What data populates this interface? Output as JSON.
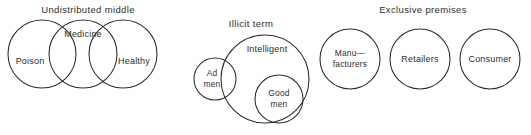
{
  "figure": {
    "background_color": "#ffffff",
    "stroke_color": "#2b2b2b",
    "text_color": "#2e2e2e",
    "width": 531,
    "height": 135
  },
  "diagrams": [
    {
      "id": "undistributed-middle",
      "title": "Undistributed middle",
      "title_x": 88,
      "title_y": 10,
      "type": "three-overlapping-circles",
      "circles": [
        {
          "name": "poison",
          "label": "Poison",
          "cx": 42,
          "cy": 54,
          "r": 34,
          "label_x": 30,
          "label_y": 62
        },
        {
          "name": "medicine",
          "label": "Medicine",
          "cx": 83,
          "cy": 54,
          "r": 34,
          "label_x": 83,
          "label_y": 35
        },
        {
          "name": "healthy",
          "label": "Healthy",
          "cx": 123,
          "cy": 54,
          "r": 34,
          "label_x": 134,
          "label_y": 62
        }
      ]
    },
    {
      "id": "illicit-term",
      "title": "Illicit term",
      "title_x": 251,
      "title_y": 24,
      "type": "nested-and-overlapping-circles",
      "circles": [
        {
          "name": "intelligent",
          "label": "Intelligent",
          "cx": 265,
          "cy": 79,
          "r": 44,
          "label_x": 267,
          "label_y": 50
        },
        {
          "name": "ad-men",
          "label": "Ad",
          "label2": "men",
          "cx": 215,
          "cy": 79,
          "r": 21,
          "label_x": 212,
          "label_y": 74
        },
        {
          "name": "good-men",
          "label": "Good",
          "label2": "men",
          "cx": 279,
          "cy": 99,
          "r": 24,
          "label_x": 279,
          "label_y": 94
        }
      ]
    },
    {
      "id": "exclusive-premises",
      "title": "Exclusive premises",
      "title_x": 423,
      "title_y": 10,
      "type": "three-disjoint-circles",
      "circles": [
        {
          "name": "manufacturers",
          "label": "Manu—",
          "label2": "facturers",
          "cx": 350,
          "cy": 59,
          "r": 30,
          "label_x": 350,
          "label_y": 54
        },
        {
          "name": "retailers",
          "label": "Retailers",
          "cx": 420,
          "cy": 59,
          "r": 30,
          "label_x": 420,
          "label_y": 60
        },
        {
          "name": "consumer",
          "label": "Consumer",
          "cx": 490,
          "cy": 59,
          "r": 30,
          "label_x": 490,
          "label_y": 60
        }
      ]
    }
  ]
}
